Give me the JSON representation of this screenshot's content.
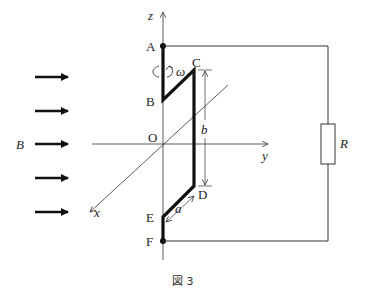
{
  "figure": {
    "caption": "図 3",
    "field_label": "B",
    "axes": {
      "z": "z",
      "y": "y",
      "x": "x",
      "origin": "O"
    },
    "points": {
      "A": "A",
      "B": "B",
      "C": "C",
      "D": "D",
      "E": "E",
      "F": "F"
    },
    "dimensions": {
      "a": "a",
      "b": "b"
    },
    "rotation_label": "ω",
    "resistor_label": "R",
    "field_arrow_count": 5,
    "colors": {
      "line": "#222222",
      "background": "#ffffff"
    }
  }
}
